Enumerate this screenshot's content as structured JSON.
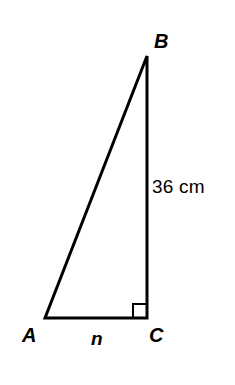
{
  "figure": {
    "name": "right-triangle-abc",
    "background_color": "#ffffff",
    "line_color": "#000000",
    "line_width": 3,
    "canvas": {
      "width": 235,
      "height": 385
    }
  },
  "vertices": {
    "a": {
      "label": "A",
      "x": 45,
      "y": 318
    },
    "b": {
      "label": "B",
      "x": 147,
      "y": 56
    },
    "c": {
      "label": "C",
      "x": 147,
      "y": 318
    }
  },
  "sides": {
    "base": {
      "name": "AC",
      "label": "n",
      "from": "a",
      "to": "c"
    },
    "vertical": {
      "name": "BC",
      "label": "36 cm",
      "from": "b",
      "to": "c"
    },
    "hypotenuse": {
      "name": "AB",
      "label": "",
      "from": "a",
      "to": "b"
    }
  },
  "angle_marker": {
    "at_vertex": "C",
    "type": "right-angle-square",
    "size": 14
  },
  "chart_data": {
    "type": "diagram",
    "title": "",
    "shape": "right triangle",
    "points": [
      {
        "id": "A",
        "x": 45,
        "y": 318
      },
      {
        "id": "B",
        "x": 147,
        "y": 56
      },
      {
        "id": "C",
        "x": 147,
        "y": 318
      }
    ],
    "edges": [
      {
        "from": "A",
        "to": "B",
        "label": ""
      },
      {
        "from": "B",
        "to": "C",
        "label": "36 cm"
      },
      {
        "from": "C",
        "to": "A",
        "label": "n"
      }
    ],
    "annotations": [
      {
        "text": "36 cm",
        "near": "BC",
        "x": 152,
        "y": 177
      },
      {
        "text": "n",
        "near": "AC",
        "x": 91,
        "y": 329
      },
      {
        "text": "A",
        "near": "A",
        "x": 22,
        "y": 325
      },
      {
        "text": "B",
        "near": "B",
        "x": 154,
        "y": 31
      },
      {
        "text": "C",
        "near": "C",
        "x": 149,
        "y": 325
      },
      {
        "text": "right angle",
        "near": "C",
        "x": 133,
        "y": 304
      }
    ]
  }
}
